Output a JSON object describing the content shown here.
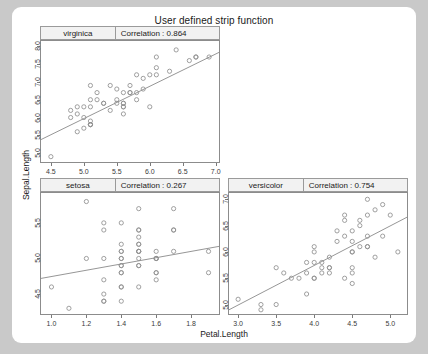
{
  "plot": {
    "title": "User defined strip function",
    "xlabel": "Petal.Length",
    "ylabel": "Sepal.Length",
    "correlation_label": "Correlation :"
  },
  "chart_data": {
    "type": "scatter",
    "title": "User defined strip function",
    "xlabel": "Petal.Length",
    "ylabel": "Sepal.Length",
    "grid": false,
    "legend": "none",
    "marker": "open-circle",
    "layout": "trellis-2x2",
    "panels": [
      {
        "position": "top-left",
        "level": "virginica",
        "correlation": "0.864",
        "correlation_value": 0.864,
        "xlim": [
          4.35,
          7.05
        ],
        "ylim": [
          4.75,
          8.15
        ],
        "xticks": [
          4.5,
          5.0,
          5.5,
          6.0,
          6.5,
          7.0
        ],
        "yticks": [
          5.0,
          5.5,
          6.0,
          6.5,
          7.0,
          7.5,
          8.0
        ],
        "xticklabels": [
          "4.5",
          "5.0",
          "5.5",
          "6.0",
          "6.5",
          "7.0"
        ],
        "yticklabels": [
          "5.0",
          "5.5",
          "6.0",
          "6.5",
          "7.0",
          "7.5",
          "8.0"
        ],
        "y_axis_side": "left",
        "x_axis_side": "bottom",
        "fit_line": {
          "x0": 4.35,
          "y0": 5.38,
          "x1": 7.05,
          "y1": 7.83
        },
        "points": [
          [
            6.0,
            6.3
          ],
          [
            5.1,
            5.8
          ],
          [
            5.9,
            7.1
          ],
          [
            5.6,
            6.3
          ],
          [
            5.8,
            6.5
          ],
          [
            6.6,
            7.6
          ],
          [
            4.5,
            4.9
          ],
          [
            6.3,
            7.3
          ],
          [
            5.8,
            6.7
          ],
          [
            6.1,
            7.2
          ],
          [
            5.1,
            6.5
          ],
          [
            5.3,
            6.4
          ],
          [
            5.5,
            6.8
          ],
          [
            5.0,
            5.7
          ],
          [
            5.1,
            5.8
          ],
          [
            5.3,
            6.4
          ],
          [
            5.5,
            6.5
          ],
          [
            6.7,
            7.7
          ],
          [
            6.9,
            7.7
          ],
          [
            5.0,
            6.0
          ],
          [
            5.7,
            6.9
          ],
          [
            4.9,
            5.6
          ],
          [
            6.7,
            7.7
          ],
          [
            4.9,
            6.3
          ],
          [
            5.7,
            6.7
          ],
          [
            6.0,
            7.2
          ],
          [
            4.8,
            6.2
          ],
          [
            4.9,
            6.1
          ],
          [
            5.6,
            6.4
          ],
          [
            5.8,
            7.2
          ],
          [
            6.1,
            7.4
          ],
          [
            6.4,
            7.9
          ],
          [
            5.6,
            6.4
          ],
          [
            5.1,
            6.3
          ],
          [
            5.6,
            6.1
          ],
          [
            6.1,
            7.7
          ],
          [
            5.6,
            6.3
          ],
          [
            5.5,
            6.4
          ],
          [
            4.8,
            6.0
          ],
          [
            5.4,
            6.9
          ],
          [
            5.6,
            6.7
          ],
          [
            5.1,
            6.9
          ],
          [
            5.1,
            5.8
          ],
          [
            5.9,
            6.8
          ],
          [
            5.7,
            6.7
          ],
          [
            5.2,
            6.7
          ],
          [
            5.0,
            6.3
          ],
          [
            5.2,
            6.5
          ],
          [
            5.4,
            6.2
          ],
          [
            5.1,
            5.9
          ]
        ]
      },
      {
        "position": "bottom-left",
        "level": "setosa",
        "correlation": "0.267",
        "correlation_value": 0.267,
        "xlim": [
          0.94,
          1.96
        ],
        "ylim": [
          4.22,
          5.92
        ],
        "xticks": [
          1.0,
          1.2,
          1.4,
          1.6,
          1.8
        ],
        "yticks": [
          4.5,
          5.0,
          5.5
        ],
        "xticklabels": [
          "1.0",
          "1.2",
          "1.4",
          "1.6",
          "1.8"
        ],
        "yticklabels": [
          "4.5",
          "5.0",
          "5.5"
        ],
        "y_axis_side": "left",
        "x_axis_side": "bottom",
        "fit_line": {
          "x0": 0.94,
          "y0": 4.72,
          "x1": 1.96,
          "y1": 5.17
        },
        "points": [
          [
            1.4,
            5.1
          ],
          [
            1.4,
            4.9
          ],
          [
            1.3,
            4.7
          ],
          [
            1.5,
            4.6
          ],
          [
            1.4,
            5.0
          ],
          [
            1.7,
            5.4
          ],
          [
            1.4,
            4.6
          ],
          [
            1.5,
            5.0
          ],
          [
            1.4,
            4.4
          ],
          [
            1.5,
            4.9
          ],
          [
            1.5,
            5.4
          ],
          [
            1.6,
            4.8
          ],
          [
            1.4,
            4.8
          ],
          [
            1.1,
            4.3
          ],
          [
            1.2,
            5.8
          ],
          [
            1.5,
            5.7
          ],
          [
            1.3,
            5.4
          ],
          [
            1.4,
            5.1
          ],
          [
            1.7,
            5.7
          ],
          [
            1.5,
            5.1
          ],
          [
            1.7,
            5.4
          ],
          [
            1.5,
            5.1
          ],
          [
            1.0,
            4.6
          ],
          [
            1.7,
            5.1
          ],
          [
            1.9,
            4.8
          ],
          [
            1.6,
            5.0
          ],
          [
            1.6,
            5.0
          ],
          [
            1.5,
            5.2
          ],
          [
            1.4,
            5.2
          ],
          [
            1.6,
            4.7
          ],
          [
            1.6,
            4.8
          ],
          [
            1.5,
            5.4
          ],
          [
            1.5,
            5.2
          ],
          [
            1.4,
            5.5
          ],
          [
            1.5,
            4.9
          ],
          [
            1.2,
            5.0
          ],
          [
            1.3,
            5.5
          ],
          [
            1.4,
            4.9
          ],
          [
            1.3,
            4.4
          ],
          [
            1.5,
            5.1
          ],
          [
            1.3,
            5.0
          ],
          [
            1.3,
            4.5
          ],
          [
            1.3,
            4.4
          ],
          [
            1.6,
            5.0
          ],
          [
            1.9,
            5.1
          ],
          [
            1.4,
            4.8
          ],
          [
            1.6,
            5.1
          ],
          [
            1.4,
            4.6
          ],
          [
            1.5,
            5.3
          ],
          [
            1.4,
            5.0
          ]
        ]
      },
      {
        "position": "bottom-right",
        "level": "versicolor",
        "correlation": "0.754",
        "correlation_value": 0.754,
        "xlim": [
          2.88,
          5.22
        ],
        "ylim": [
          4.82,
          7.12
        ],
        "xticks": [
          3.0,
          3.5,
          4.0,
          4.5,
          5.0
        ],
        "yticks": [
          5.0,
          5.5,
          6.0,
          6.5,
          7.0
        ],
        "xticklabels": [
          "3.0",
          "3.5",
          "4.0",
          "4.5",
          "5.0"
        ],
        "yticklabels": [
          "5.0",
          "5.5",
          "6.0",
          "6.5",
          "7.0"
        ],
        "y_axis_side": "left",
        "x_axis_side": "bottom",
        "fit_line": {
          "x0": 2.88,
          "y0": 4.9,
          "x1": 5.22,
          "y1": 6.66
        },
        "points": [
          [
            4.7,
            7.0
          ],
          [
            4.5,
            6.4
          ],
          [
            4.9,
            6.9
          ],
          [
            4.0,
            5.5
          ],
          [
            4.6,
            6.5
          ],
          [
            4.5,
            5.7
          ],
          [
            4.7,
            6.3
          ],
          [
            3.3,
            4.9
          ],
          [
            4.6,
            6.6
          ],
          [
            3.9,
            5.2
          ],
          [
            3.5,
            5.0
          ],
          [
            4.2,
            5.9
          ],
          [
            4.0,
            6.0
          ],
          [
            4.7,
            6.1
          ],
          [
            3.6,
            5.6
          ],
          [
            4.4,
            6.7
          ],
          [
            4.5,
            5.6
          ],
          [
            4.1,
            5.8
          ],
          [
            4.5,
            6.2
          ],
          [
            3.9,
            5.6
          ],
          [
            4.8,
            5.9
          ],
          [
            4.0,
            6.1
          ],
          [
            4.9,
            6.3
          ],
          [
            4.7,
            6.1
          ],
          [
            4.3,
            6.4
          ],
          [
            4.4,
            6.6
          ],
          [
            4.8,
            6.8
          ],
          [
            5.0,
            6.7
          ],
          [
            4.5,
            6.0
          ],
          [
            3.5,
            5.7
          ],
          [
            3.8,
            5.5
          ],
          [
            3.7,
            5.5
          ],
          [
            3.9,
            5.8
          ],
          [
            5.1,
            6.0
          ],
          [
            4.5,
            5.4
          ],
          [
            4.5,
            6.0
          ],
          [
            4.7,
            6.7
          ],
          [
            4.4,
            6.3
          ],
          [
            4.1,
            5.6
          ],
          [
            4.0,
            5.5
          ],
          [
            4.4,
            5.5
          ],
          [
            4.6,
            6.1
          ],
          [
            4.0,
            5.8
          ],
          [
            3.3,
            5.0
          ],
          [
            4.2,
            5.6
          ],
          [
            4.2,
            5.7
          ],
          [
            4.2,
            5.7
          ],
          [
            4.3,
            6.2
          ],
          [
            3.0,
            5.1
          ],
          [
            4.1,
            5.7
          ]
        ]
      }
    ]
  }
}
